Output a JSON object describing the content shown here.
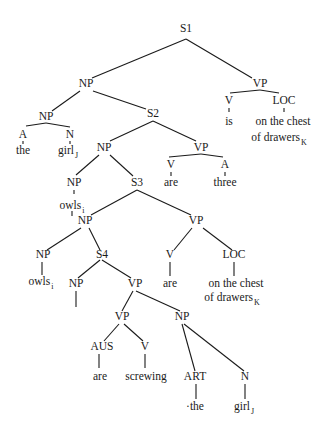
{
  "diagram": {
    "type": "syntax-tree",
    "nodes": [
      {
        "id": "s1",
        "label": "S1",
        "x": 186,
        "y": 32
      },
      {
        "id": "np1",
        "label": "NP",
        "x": 86,
        "y": 87
      },
      {
        "id": "vp1",
        "label": "VP",
        "x": 260,
        "y": 87
      },
      {
        "id": "np2",
        "label": "NP",
        "x": 46,
        "y": 120
      },
      {
        "id": "s2",
        "label": "S2",
        "x": 153,
        "y": 117
      },
      {
        "id": "a1",
        "label": "A",
        "x": 23,
        "y": 138
      },
      {
        "id": "a1w",
        "label": "the",
        "x": 23,
        "y": 154
      },
      {
        "id": "n1",
        "label": "N",
        "x": 70,
        "y": 138
      },
      {
        "id": "n1w",
        "label": "girl",
        "sub": "J",
        "x": 68,
        "y": 154
      },
      {
        "id": "v1",
        "label": "V",
        "x": 229,
        "y": 104
      },
      {
        "id": "v1w",
        "label": "is",
        "x": 229,
        "y": 125
      },
      {
        "id": "loc1",
        "label": "LOC",
        "x": 284,
        "y": 104
      },
      {
        "id": "loc1w1",
        "label": "on the chest",
        "x": 283,
        "y": 125
      },
      {
        "id": "loc1w2",
        "label": "of drawers",
        "sub": "K",
        "x": 279,
        "y": 141
      },
      {
        "id": "np3",
        "label": "NP",
        "x": 104,
        "y": 151
      },
      {
        "id": "vp2",
        "label": "VP",
        "x": 201,
        "y": 151
      },
      {
        "id": "v2",
        "label": "V",
        "x": 171,
        "y": 168
      },
      {
        "id": "v2w",
        "label": "are",
        "x": 171,
        "y": 186
      },
      {
        "id": "a2",
        "label": "A",
        "x": 225,
        "y": 168
      },
      {
        "id": "a2w",
        "label": "three",
        "x": 225,
        "y": 186
      },
      {
        "id": "np4",
        "label": "NP",
        "x": 74,
        "y": 186
      },
      {
        "id": "np4w",
        "label": "owls",
        "sub": "i",
        "x": 72,
        "y": 209
      },
      {
        "id": "s3",
        "label": "S3",
        "x": 137,
        "y": 186
      },
      {
        "id": "np5",
        "label": "NP",
        "x": 85,
        "y": 224
      },
      {
        "id": "vp3",
        "label": "VP",
        "x": 196,
        "y": 224
      },
      {
        "id": "np6",
        "label": "NP",
        "x": 43,
        "y": 258
      },
      {
        "id": "np6w",
        "label": "owls",
        "sub": "i",
        "x": 41,
        "y": 285
      },
      {
        "id": "s4",
        "label": "S4",
        "x": 102,
        "y": 258
      },
      {
        "id": "v3",
        "label": "V",
        "x": 170,
        "y": 258
      },
      {
        "id": "v3w",
        "label": "are",
        "x": 170,
        "y": 287
      },
      {
        "id": "loc2",
        "label": "LOC",
        "x": 234,
        "y": 258
      },
      {
        "id": "loc2w1",
        "label": "on the chest",
        "x": 236,
        "y": 287
      },
      {
        "id": "loc2w2",
        "label": "of drawers",
        "sub": "K",
        "x": 232,
        "y": 301
      },
      {
        "id": "np7",
        "label": "NP",
        "x": 76,
        "y": 287
      },
      {
        "id": "vp4",
        "label": "VP",
        "x": 135,
        "y": 287
      },
      {
        "id": "vp5",
        "label": "VP",
        "x": 122,
        "y": 320
      },
      {
        "id": "np8",
        "label": "NP",
        "x": 182,
        "y": 320
      },
      {
        "id": "aus",
        "label": "AUS",
        "x": 102,
        "y": 350
      },
      {
        "id": "ausw",
        "label": "are",
        "x": 100,
        "y": 380
      },
      {
        "id": "v4",
        "label": "V",
        "x": 145,
        "y": 350
      },
      {
        "id": "v4w",
        "label": "screwing",
        "x": 146,
        "y": 380
      },
      {
        "id": "art",
        "label": "ART",
        "x": 195,
        "y": 380
      },
      {
        "id": "artw",
        "label": "·the",
        "x": 195,
        "y": 410
      },
      {
        "id": "n2",
        "label": "N",
        "x": 245,
        "y": 380
      },
      {
        "id": "n2w",
        "label": "girl",
        "sub": "J",
        "x": 244,
        "y": 410
      }
    ],
    "edges": [
      {
        "name": "s1-np",
        "x1": 186,
        "y1": 39,
        "x2": 92,
        "y2": 78
      },
      {
        "name": "s1-vp",
        "x1": 186,
        "y1": 39,
        "x2": 252,
        "y2": 78
      },
      {
        "name": "np-np",
        "x1": 80,
        "y1": 91,
        "x2": 52,
        "y2": 111
      },
      {
        "name": "np-s2",
        "x1": 93,
        "y1": 91,
        "x2": 146,
        "y2": 109
      },
      {
        "name": "vp-v-lo",
        "x1": 230,
        "y1": 93,
        "x2": 260,
        "y2": 90
      },
      {
        "name": "vp-loc",
        "x1": 260,
        "y1": 90,
        "x2": 279,
        "y2": 93
      },
      {
        "name": "np2-a",
        "x1": 26,
        "y1": 126,
        "x2": 46,
        "y2": 123
      },
      {
        "name": "np2-n",
        "x1": 46,
        "y1": 123,
        "x2": 70,
        "y2": 127
      },
      {
        "name": "a-the",
        "x1": 23,
        "y1": 141,
        "x2": 23,
        "y2": 144
      },
      {
        "name": "n-girl",
        "x1": 70,
        "y1": 141,
        "x2": 70,
        "y2": 144
      },
      {
        "name": "v-is",
        "x1": 229,
        "y1": 108,
        "x2": 229,
        "y2": 112
      },
      {
        "name": "loc-on",
        "x1": 284,
        "y1": 108,
        "x2": 284,
        "y2": 112
      },
      {
        "name": "s2-np",
        "x1": 153,
        "y1": 121,
        "x2": 110,
        "y2": 141
      },
      {
        "name": "s2-vp",
        "x1": 153,
        "y1": 121,
        "x2": 196,
        "y2": 141
      },
      {
        "name": "vp2-v",
        "x1": 169,
        "y1": 157,
        "x2": 201,
        "y2": 154
      },
      {
        "name": "vp2-a",
        "x1": 201,
        "y1": 154,
        "x2": 223,
        "y2": 157
      },
      {
        "name": "v2-are",
        "x1": 171,
        "y1": 172,
        "x2": 171,
        "y2": 176
      },
      {
        "name": "a2-three",
        "x1": 225,
        "y1": 172,
        "x2": 225,
        "y2": 176
      },
      {
        "name": "np3-np",
        "x1": 99,
        "y1": 155,
        "x2": 76,
        "y2": 175
      },
      {
        "name": "np3-s3",
        "x1": 110,
        "y1": 155,
        "x2": 133,
        "y2": 176
      },
      {
        "name": "np4-owls",
        "x1": 74,
        "y1": 190,
        "x2": 74,
        "y2": 194
      },
      {
        "name": "owls-stub",
        "x1": 72,
        "y1": 211,
        "x2": 72,
        "y2": 216
      },
      {
        "name": "s3-np",
        "x1": 137,
        "y1": 190,
        "x2": 91,
        "y2": 215
      },
      {
        "name": "s3-vp",
        "x1": 137,
        "y1": 190,
        "x2": 191,
        "y2": 215
      },
      {
        "name": "np5-np",
        "x1": 81,
        "y1": 228,
        "x2": 47,
        "y2": 250
      },
      {
        "name": "np5-s4",
        "x1": 89,
        "y1": 228,
        "x2": 100,
        "y2": 250
      },
      {
        "name": "vp3-v",
        "x1": 192,
        "y1": 228,
        "x2": 174,
        "y2": 250
      },
      {
        "name": "vp3-loc",
        "x1": 203,
        "y1": 228,
        "x2": 232,
        "y2": 250
      },
      {
        "name": "np6-owls",
        "x1": 42,
        "y1": 262,
        "x2": 42,
        "y2": 275
      },
      {
        "name": "v3-are",
        "x1": 170,
        "y1": 262,
        "x2": 170,
        "y2": 276
      },
      {
        "name": "loc2-on",
        "x1": 234,
        "y1": 262,
        "x2": 234,
        "y2": 276
      },
      {
        "name": "s4-np",
        "x1": 100,
        "y1": 260,
        "x2": 78,
        "y2": 278
      },
      {
        "name": "s4-vp",
        "x1": 102,
        "y1": 260,
        "x2": 131,
        "y2": 278
      },
      {
        "name": "np7-stub",
        "x1": 76,
        "y1": 291,
        "x2": 76,
        "y2": 307
      },
      {
        "name": "vp4-vp",
        "x1": 133,
        "y1": 291,
        "x2": 122,
        "y2": 311
      },
      {
        "name": "vp4-np",
        "x1": 136,
        "y1": 291,
        "x2": 180,
        "y2": 311
      },
      {
        "name": "vp5-aus",
        "x1": 119,
        "y1": 324,
        "x2": 104,
        "y2": 341
      },
      {
        "name": "vp5-v",
        "x1": 124,
        "y1": 324,
        "x2": 143,
        "y2": 341
      },
      {
        "name": "np8-art",
        "x1": 182,
        "y1": 324,
        "x2": 195,
        "y2": 371
      },
      {
        "name": "np8-n",
        "x1": 184,
        "y1": 324,
        "x2": 244,
        "y2": 371
      },
      {
        "name": "aus-are",
        "x1": 99,
        "y1": 354,
        "x2": 99,
        "y2": 368
      },
      {
        "name": "v4-screwing",
        "x1": 145,
        "y1": 354,
        "x2": 145,
        "y2": 368
      },
      {
        "name": "art-the",
        "x1": 196,
        "y1": 384,
        "x2": 196,
        "y2": 399
      },
      {
        "name": "n2-girl",
        "x1": 245,
        "y1": 384,
        "x2": 245,
        "y2": 399
      }
    ]
  }
}
